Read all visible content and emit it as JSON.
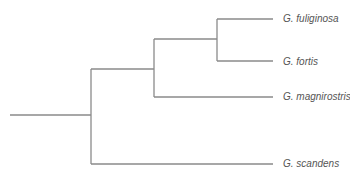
{
  "diagram": {
    "type": "phylogenetic-tree",
    "line_color": "#8a8a8a",
    "label_color": "#555555",
    "taxa": [
      {
        "name": "G. fuliginosa",
        "y": 19
      },
      {
        "name": "G. fortis",
        "y": 61
      },
      {
        "name": "G. magnirostris",
        "y": 97
      },
      {
        "name": "G. scandens",
        "y": 164
      }
    ]
  }
}
